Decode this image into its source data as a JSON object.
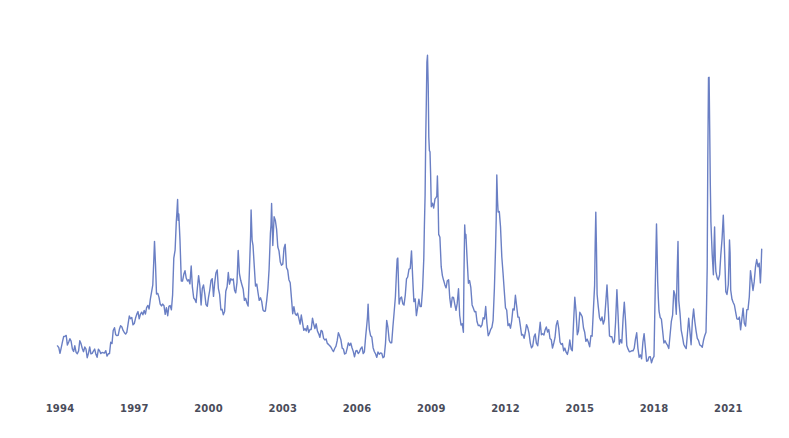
{
  "chart_data": {
    "type": "line",
    "title": "",
    "xlabel": "",
    "ylabel": "",
    "grid": false,
    "legend": null,
    "x_tick_labels": [
      "1994",
      "1997",
      "2000",
      "2003",
      "2006",
      "2009",
      "2012",
      "2015",
      "2018",
      "2021"
    ],
    "xlim": [
      1993.9,
      2022.4
    ],
    "ylim_estimated": [
      9,
      82
    ],
    "line_color": "#6a7fc4",
    "series": [
      {
        "name": "Volatility index (estimated)",
        "points": [
          [
            1993.9,
            13
          ],
          [
            1994.0,
            12
          ],
          [
            1994.1,
            14
          ],
          [
            1994.2,
            16
          ],
          [
            1994.3,
            13
          ],
          [
            1994.4,
            15
          ],
          [
            1994.5,
            12
          ],
          [
            1994.6,
            13
          ],
          [
            1994.7,
            11
          ],
          [
            1994.8,
            14
          ],
          [
            1994.9,
            13
          ],
          [
            1995.0,
            12
          ],
          [
            1995.1,
            11
          ],
          [
            1995.2,
            12
          ],
          [
            1995.3,
            11.5
          ],
          [
            1995.4,
            12
          ],
          [
            1995.5,
            11
          ],
          [
            1995.6,
            12
          ],
          [
            1995.7,
            11.5
          ],
          [
            1995.8,
            12
          ],
          [
            1995.9,
            11
          ],
          [
            1996.0,
            12
          ],
          [
            1996.1,
            14
          ],
          [
            1996.2,
            17
          ],
          [
            1996.3,
            15
          ],
          [
            1996.4,
            16
          ],
          [
            1996.5,
            18
          ],
          [
            1996.6,
            16
          ],
          [
            1996.7,
            17
          ],
          [
            1996.8,
            19
          ],
          [
            1996.9,
            18
          ],
          [
            1997.0,
            18
          ],
          [
            1997.1,
            20
          ],
          [
            1997.2,
            19
          ],
          [
            1997.3,
            21
          ],
          [
            1997.4,
            20
          ],
          [
            1997.5,
            22
          ],
          [
            1997.6,
            20
          ],
          [
            1997.75,
            25
          ],
          [
            1997.82,
            35
          ],
          [
            1997.9,
            26
          ],
          [
            1998.0,
            24
          ],
          [
            1998.1,
            22
          ],
          [
            1998.2,
            21
          ],
          [
            1998.3,
            20
          ],
          [
            1998.4,
            22
          ],
          [
            1998.5,
            21
          ],
          [
            1998.6,
            30
          ],
          [
            1998.7,
            38
          ],
          [
            1998.75,
            45
          ],
          [
            1998.8,
            40
          ],
          [
            1998.9,
            28
          ],
          [
            1999.0,
            30
          ],
          [
            1999.1,
            27
          ],
          [
            1999.2,
            26
          ],
          [
            1999.3,
            29
          ],
          [
            1999.4,
            25
          ],
          [
            1999.5,
            24
          ],
          [
            1999.6,
            27
          ],
          [
            1999.7,
            23
          ],
          [
            1999.8,
            28
          ],
          [
            1999.9,
            22
          ],
          [
            2000.0,
            24
          ],
          [
            2000.1,
            28
          ],
          [
            2000.2,
            25
          ],
          [
            2000.3,
            31
          ],
          [
            2000.4,
            27
          ],
          [
            2000.5,
            22
          ],
          [
            2000.6,
            20
          ],
          [
            2000.7,
            24
          ],
          [
            2000.8,
            28
          ],
          [
            2000.9,
            26
          ],
          [
            2001.0,
            27
          ],
          [
            2001.1,
            25
          ],
          [
            2001.2,
            32
          ],
          [
            2001.3,
            29
          ],
          [
            2001.4,
            26
          ],
          [
            2001.5,
            23
          ],
          [
            2001.6,
            22
          ],
          [
            2001.7,
            35
          ],
          [
            2001.72,
            43
          ],
          [
            2001.8,
            33
          ],
          [
            2001.9,
            26
          ],
          [
            2002.0,
            24
          ],
          [
            2002.1,
            22
          ],
          [
            2002.2,
            21
          ],
          [
            2002.3,
            20
          ],
          [
            2002.4,
            24
          ],
          [
            2002.5,
            35
          ],
          [
            2002.55,
            42
          ],
          [
            2002.6,
            37
          ],
          [
            2002.7,
            40
          ],
          [
            2002.8,
            35
          ],
          [
            2002.9,
            30
          ],
          [
            2003.0,
            31
          ],
          [
            2003.1,
            34
          ],
          [
            2003.2,
            30
          ],
          [
            2003.3,
            25
          ],
          [
            2003.4,
            21
          ],
          [
            2003.5,
            21
          ],
          [
            2003.6,
            20
          ],
          [
            2003.7,
            19
          ],
          [
            2003.8,
            18
          ],
          [
            2003.9,
            17
          ],
          [
            2004.0,
            17
          ],
          [
            2004.1,
            16
          ],
          [
            2004.2,
            18
          ],
          [
            2004.3,
            17
          ],
          [
            2004.4,
            17
          ],
          [
            2004.5,
            15
          ],
          [
            2004.6,
            16
          ],
          [
            2004.7,
            15
          ],
          [
            2004.8,
            14
          ],
          [
            2004.9,
            13
          ],
          [
            2005.0,
            13
          ],
          [
            2005.1,
            12
          ],
          [
            2005.2,
            14
          ],
          [
            2005.3,
            16
          ],
          [
            2005.4,
            13
          ],
          [
            2005.5,
            12
          ],
          [
            2005.6,
            12
          ],
          [
            2005.7,
            14
          ],
          [
            2005.8,
            13
          ],
          [
            2005.9,
            11
          ],
          [
            2006.0,
            12
          ],
          [
            2006.1,
            11.5
          ],
          [
            2006.2,
            12
          ],
          [
            2006.3,
            11
          ],
          [
            2006.4,
            18
          ],
          [
            2006.45,
            23
          ],
          [
            2006.5,
            16
          ],
          [
            2006.6,
            14
          ],
          [
            2006.7,
            12
          ],
          [
            2006.8,
            11
          ],
          [
            2006.9,
            11
          ],
          [
            2007.0,
            11
          ],
          [
            2007.1,
            10.5
          ],
          [
            2007.2,
            18
          ],
          [
            2007.3,
            14
          ],
          [
            2007.4,
            14
          ],
          [
            2007.5,
            20
          ],
          [
            2007.6,
            30
          ],
          [
            2007.65,
            31
          ],
          [
            2007.7,
            22
          ],
          [
            2007.8,
            24
          ],
          [
            2007.9,
            23
          ],
          [
            2008.0,
            26
          ],
          [
            2008.1,
            28
          ],
          [
            2008.2,
            32
          ],
          [
            2008.3,
            24
          ],
          [
            2008.4,
            20
          ],
          [
            2008.5,
            24
          ],
          [
            2008.6,
            22
          ],
          [
            2008.7,
            30
          ],
          [
            2008.75,
            45
          ],
          [
            2008.8,
            70
          ],
          [
            2008.85,
            80
          ],
          [
            2008.9,
            60
          ],
          [
            2008.95,
            55
          ],
          [
            2009.0,
            45
          ],
          [
            2009.1,
            42
          ],
          [
            2009.2,
            48
          ],
          [
            2009.25,
            50
          ],
          [
            2009.3,
            40
          ],
          [
            2009.4,
            32
          ],
          [
            2009.5,
            28
          ],
          [
            2009.6,
            25
          ],
          [
            2009.7,
            26
          ],
          [
            2009.8,
            23
          ],
          [
            2009.9,
            22
          ],
          [
            2010.0,
            20
          ],
          [
            2010.1,
            24
          ],
          [
            2010.2,
            18
          ],
          [
            2010.3,
            17
          ],
          [
            2010.35,
            40
          ],
          [
            2010.4,
            35
          ],
          [
            2010.5,
            28
          ],
          [
            2010.6,
            25
          ],
          [
            2010.7,
            22
          ],
          [
            2010.8,
            21
          ],
          [
            2010.9,
            18
          ],
          [
            2011.0,
            17
          ],
          [
            2011.1,
            18
          ],
          [
            2011.2,
            22
          ],
          [
            2011.3,
            16
          ],
          [
            2011.4,
            17
          ],
          [
            2011.5,
            19
          ],
          [
            2011.6,
            35
          ],
          [
            2011.65,
            48
          ],
          [
            2011.7,
            42
          ],
          [
            2011.8,
            38
          ],
          [
            2011.9,
            28
          ],
          [
            2012.0,
            22
          ],
          [
            2012.1,
            18
          ],
          [
            2012.2,
            17
          ],
          [
            2012.3,
            20
          ],
          [
            2012.4,
            24
          ],
          [
            2012.5,
            20
          ],
          [
            2012.6,
            17
          ],
          [
            2012.7,
            15
          ],
          [
            2012.8,
            16
          ],
          [
            2012.9,
            18
          ],
          [
            2013.0,
            14
          ],
          [
            2013.1,
            13
          ],
          [
            2013.2,
            16
          ],
          [
            2013.3,
            13
          ],
          [
            2013.4,
            18
          ],
          [
            2013.5,
            15
          ],
          [
            2013.6,
            16
          ],
          [
            2013.7,
            17
          ],
          [
            2013.8,
            14
          ],
          [
            2013.9,
            13
          ],
          [
            2014.0,
            15
          ],
          [
            2014.1,
            18
          ],
          [
            2014.2,
            14
          ],
          [
            2014.3,
            13
          ],
          [
            2014.4,
            12
          ],
          [
            2014.5,
            11
          ],
          [
            2014.6,
            14
          ],
          [
            2014.7,
            12
          ],
          [
            2014.8,
            25
          ],
          [
            2014.9,
            16
          ],
          [
            2015.0,
            19
          ],
          [
            2015.1,
            20
          ],
          [
            2015.2,
            15
          ],
          [
            2015.3,
            14
          ],
          [
            2015.4,
            13
          ],
          [
            2015.5,
            16
          ],
          [
            2015.6,
            28
          ],
          [
            2015.65,
            40
          ],
          [
            2015.7,
            26
          ],
          [
            2015.8,
            20
          ],
          [
            2015.9,
            18
          ],
          [
            2016.0,
            20
          ],
          [
            2016.1,
            26
          ],
          [
            2016.2,
            16
          ],
          [
            2016.3,
            15
          ],
          [
            2016.4,
            14
          ],
          [
            2016.5,
            25
          ],
          [
            2016.6,
            13
          ],
          [
            2016.7,
            14
          ],
          [
            2016.8,
            22
          ],
          [
            2016.9,
            14
          ],
          [
            2017.0,
            12
          ],
          [
            2017.1,
            11.5
          ],
          [
            2017.2,
            12
          ],
          [
            2017.3,
            15
          ],
          [
            2017.4,
            11
          ],
          [
            2017.5,
            10.5
          ],
          [
            2017.6,
            16
          ],
          [
            2017.7,
            10
          ],
          [
            2017.8,
            10
          ],
          [
            2017.9,
            10
          ],
          [
            2018.0,
            11
          ],
          [
            2018.1,
            37
          ],
          [
            2018.15,
            28
          ],
          [
            2018.2,
            20
          ],
          [
            2018.3,
            18
          ],
          [
            2018.4,
            14
          ],
          [
            2018.5,
            13
          ],
          [
            2018.6,
            12
          ],
          [
            2018.8,
            24
          ],
          [
            2018.9,
            21
          ],
          [
            2018.97,
            36
          ],
          [
            2019.0,
            24
          ],
          [
            2019.1,
            17
          ],
          [
            2019.2,
            14
          ],
          [
            2019.3,
            13
          ],
          [
            2019.4,
            19
          ],
          [
            2019.5,
            14
          ],
          [
            2019.6,
            22
          ],
          [
            2019.7,
            17
          ],
          [
            2019.8,
            14
          ],
          [
            2019.9,
            13
          ],
          [
            2020.0,
            14
          ],
          [
            2020.1,
            15
          ],
          [
            2020.15,
            30
          ],
          [
            2020.2,
            75
          ],
          [
            2020.25,
            60
          ],
          [
            2020.3,
            40
          ],
          [
            2020.4,
            30
          ],
          [
            2020.45,
            38
          ],
          [
            2020.5,
            28
          ],
          [
            2020.6,
            26
          ],
          [
            2020.7,
            32
          ],
          [
            2020.8,
            40
          ],
          [
            2020.9,
            24
          ],
          [
            2021.0,
            25
          ],
          [
            2021.05,
            35
          ],
          [
            2021.1,
            27
          ],
          [
            2021.2,
            22
          ],
          [
            2021.3,
            19
          ],
          [
            2021.4,
            20
          ],
          [
            2021.5,
            17
          ],
          [
            2021.6,
            20
          ],
          [
            2021.7,
            18
          ],
          [
            2021.8,
            22
          ],
          [
            2021.9,
            28
          ],
          [
            2022.0,
            24
          ],
          [
            2022.1,
            30
          ],
          [
            2022.2,
            32
          ],
          [
            2022.3,
            28
          ],
          [
            2022.35,
            34
          ]
        ]
      }
    ]
  }
}
